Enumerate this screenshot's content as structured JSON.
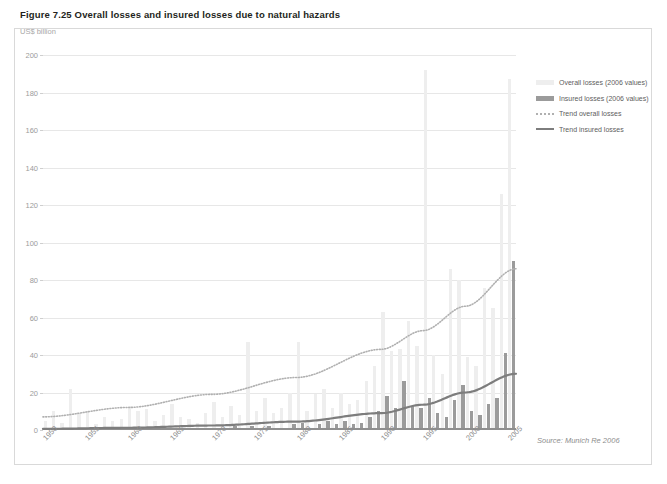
{
  "figure": {
    "title": "Figure 7.25 Overall losses and insured losses due to natural hazards",
    "unit_label": "US$ billion",
    "source": "Source: Munich Re 2006"
  },
  "legend": {
    "position": "right",
    "items": [
      {
        "label": "Overall losses (2006 values)",
        "style": "bar",
        "color": "#eeeeee"
      },
      {
        "label": "Insured losses (2006 values)",
        "style": "bar",
        "color": "#9b9b9b"
      },
      {
        "label": "Trend overall losses",
        "style": "dotted-line",
        "color": "#b0b0b0"
      },
      {
        "label": "Trend insured losses",
        "style": "solid-line",
        "color": "#7d7d7d"
      }
    ]
  },
  "chart_data": {
    "type": "bar",
    "title": "Figure 7.25 Overall losses and insured losses due to natural hazards",
    "xlabel": "",
    "ylabel": "US$ billion",
    "ylim": [
      0,
      200
    ],
    "ytick_step": 20,
    "yticks": [
      0,
      20,
      40,
      60,
      80,
      100,
      120,
      140,
      160,
      180,
      200
    ],
    "xlim": [
      1950,
      2006
    ],
    "xticks": [
      1950,
      1955,
      1960,
      1965,
      1970,
      1975,
      1980,
      1985,
      1990,
      1995,
      2000,
      2005
    ],
    "grid": true,
    "categories": [
      1950,
      1951,
      1952,
      1953,
      1954,
      1955,
      1956,
      1957,
      1958,
      1959,
      1960,
      1961,
      1962,
      1963,
      1964,
      1965,
      1966,
      1967,
      1968,
      1969,
      1970,
      1971,
      1972,
      1973,
      1974,
      1975,
      1976,
      1977,
      1978,
      1979,
      1980,
      1981,
      1982,
      1983,
      1984,
      1985,
      1986,
      1987,
      1988,
      1989,
      1990,
      1991,
      1992,
      1993,
      1994,
      1995,
      1996,
      1997,
      1998,
      1999,
      2000,
      2001,
      2002,
      2003,
      2004,
      2005
    ],
    "series": [
      {
        "name": "Overall losses (2006 values)",
        "color": "#eeeeee",
        "values": [
          5,
          10,
          4,
          22,
          9,
          10,
          3,
          7,
          5,
          6,
          13,
          10,
          11,
          5,
          8,
          14,
          7,
          6,
          4,
          9,
          15,
          7,
          13,
          8,
          47,
          10,
          17,
          9,
          12,
          20,
          47,
          10,
          19,
          22,
          12,
          20,
          14,
          16,
          26,
          34,
          63,
          42,
          43,
          58,
          45,
          192,
          40,
          30,
          86,
          80,
          39,
          34,
          76,
          65,
          126,
          187
        ]
      },
      {
        "name": "Insured losses (2006 values)",
        "color": "#9b9b9b",
        "values": [
          0,
          0,
          0,
          1,
          0,
          1,
          0,
          0,
          0,
          0,
          0,
          0,
          1,
          0,
          0,
          1,
          0,
          0,
          0,
          0,
          1,
          0,
          2,
          0,
          2,
          1,
          2,
          1,
          1,
          3,
          4,
          1,
          3,
          5,
          3,
          5,
          3,
          4,
          7,
          10,
          18,
          12,
          26,
          13,
          12,
          17,
          9,
          7,
          16,
          24,
          10,
          8,
          14,
          17,
          41,
          90
        ]
      }
    ],
    "trend_lines": [
      {
        "name": "Trend overall losses",
        "style": "dotted",
        "color": "#b0b0b0",
        "points": [
          [
            1950,
            7
          ],
          [
            1960,
            12
          ],
          [
            1970,
            19
          ],
          [
            1980,
            28
          ],
          [
            1990,
            43
          ],
          [
            1995,
            53
          ],
          [
            2000,
            66
          ],
          [
            2006,
            86
          ]
        ]
      },
      {
        "name": "Trend insured losses",
        "style": "solid",
        "color": "#7d7d7d",
        "points": [
          [
            1950,
            0.6
          ],
          [
            1960,
            1.2
          ],
          [
            1970,
            2.4
          ],
          [
            1980,
            4.5
          ],
          [
            1990,
            9
          ],
          [
            1995,
            13.5
          ],
          [
            2000,
            20
          ],
          [
            2006,
            30
          ]
        ]
      }
    ]
  }
}
